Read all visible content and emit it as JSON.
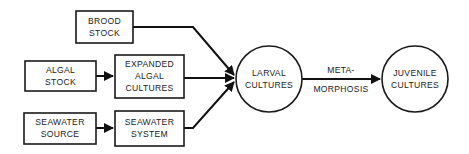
{
  "diagram": {
    "nodes": [
      {
        "id": "brood-stock",
        "shape": "box",
        "lines": [
          "BROOD",
          "STOCK"
        ]
      },
      {
        "id": "algal-stock",
        "shape": "box",
        "lines": [
          "ALGAL",
          "STOCK"
        ]
      },
      {
        "id": "expanded-algal-cultures",
        "shape": "box",
        "lines": [
          "EXPANDED",
          "ALGAL",
          "CULTURES"
        ]
      },
      {
        "id": "seawater-source",
        "shape": "box",
        "lines": [
          "SEAWATER",
          "SOURCE"
        ]
      },
      {
        "id": "seawater-system",
        "shape": "box",
        "lines": [
          "SEAWATER",
          "SYSTEM"
        ]
      },
      {
        "id": "larval-cultures",
        "shape": "circle",
        "lines": [
          "LARVAL",
          "CULTURES"
        ]
      },
      {
        "id": "juvenile-cultures",
        "shape": "circle",
        "lines": [
          "JUVENILE",
          "CULTURES"
        ]
      }
    ],
    "edges": [
      {
        "from": "algal-stock",
        "to": "expanded-algal-cultures",
        "label": ""
      },
      {
        "from": "seawater-source",
        "to": "seawater-system",
        "label": ""
      },
      {
        "from": "brood-stock",
        "to": "larval-cultures",
        "label": ""
      },
      {
        "from": "expanded-algal-cultures",
        "to": "larval-cultures",
        "label": ""
      },
      {
        "from": "seawater-system",
        "to": "larval-cultures",
        "label": ""
      },
      {
        "from": "larval-cultures",
        "to": "juvenile-cultures",
        "label_lines": [
          "META-",
          "MORPHOSIS"
        ]
      }
    ],
    "colors": {
      "stroke": "#1a1a1a",
      "text": "#222222",
      "background": "#ffffff"
    }
  }
}
